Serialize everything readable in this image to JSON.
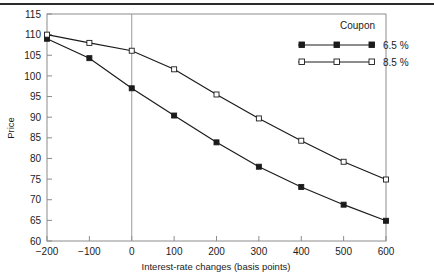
{
  "chart_data": {
    "type": "line",
    "title": "",
    "xlabel": "Interest-rate changes (basis points)",
    "ylabel": "Price",
    "x": [
      -200,
      -100,
      0,
      100,
      200,
      300,
      400,
      500,
      600
    ],
    "xlim": [
      -200,
      600
    ],
    "ylim": [
      60,
      115
    ],
    "xticks": [
      "-200",
      "-100",
      "0",
      "100",
      "200",
      "300",
      "400",
      "500",
      "600"
    ],
    "yticks": [
      "60",
      "65",
      "70",
      "75",
      "80",
      "85",
      "90",
      "95",
      "100",
      "105",
      "110",
      "115"
    ],
    "grid": false,
    "legend_position": "top-right",
    "legend_title": "Coupon",
    "reference_line_x": 0,
    "series": [
      {
        "name": "6.5 %",
        "marker": "filled-square",
        "color": "#1b1b1b",
        "values": [
          109.0,
          104.3,
          97.0,
          90.4,
          83.9,
          78.0,
          73.1,
          68.8,
          64.9
        ]
      },
      {
        "name": "8.5 %",
        "marker": "open-square",
        "color": "#1b1b1b",
        "values": [
          110.0,
          108.0,
          106.1,
          101.6,
          95.5,
          89.7,
          84.3,
          79.2,
          74.9
        ]
      }
    ]
  },
  "axis": {
    "ylabel": "Price",
    "xlabel": "Interest-rate changes (basis points)"
  },
  "legend": {
    "title": "Coupon",
    "items": [
      {
        "label": "6.5 %",
        "marker": "filled-square"
      },
      {
        "label": "8.5 %",
        "marker": "open-square"
      }
    ]
  }
}
